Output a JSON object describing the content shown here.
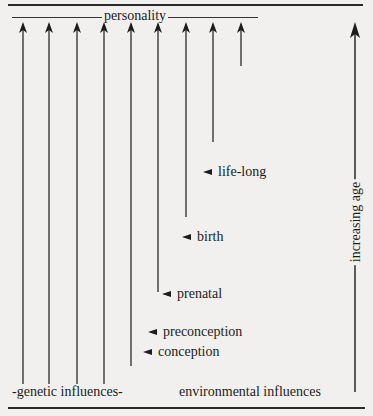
{
  "diagram": {
    "type": "influence-timeline",
    "top_label": "personality",
    "bottom_labels": {
      "genetic": "-genetic influences-",
      "environmental": "environmental influences"
    },
    "age_axis_label": "increasing age",
    "stages": [
      {
        "label": "life-long",
        "x": 203,
        "y": 173
      },
      {
        "label": "birth",
        "x": 182,
        "y": 238
      },
      {
        "label": "prenatal",
        "x": 162,
        "y": 295
      },
      {
        "label": "preconception",
        "x": 148,
        "y": 333
      },
      {
        "label": "conception",
        "x": 143,
        "y": 353
      }
    ],
    "arrows": [
      {
        "x": 23,
        "y_top": 22,
        "y_bottom": 384
      },
      {
        "x": 49,
        "y_top": 22,
        "y_bottom": 384
      },
      {
        "x": 77,
        "y_top": 22,
        "y_bottom": 384
      },
      {
        "x": 104,
        "y_top": 22,
        "y_bottom": 384
      },
      {
        "x": 131,
        "y_top": 22,
        "y_bottom": 366
      },
      {
        "x": 158,
        "y_top": 22,
        "y_bottom": 292
      },
      {
        "x": 186,
        "y_top": 22,
        "y_bottom": 217
      },
      {
        "x": 213,
        "y_top": 22,
        "y_bottom": 142
      },
      {
        "x": 241,
        "y_top": 22,
        "y_bottom": 66
      }
    ],
    "age_arrow": {
      "x": 355,
      "y_top": 22,
      "y_bottom": 392
    }
  }
}
